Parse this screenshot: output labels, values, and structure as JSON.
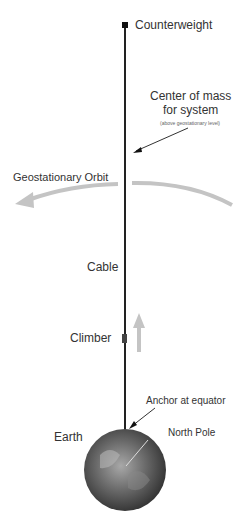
{
  "diagram": {
    "labels": {
      "counterweight": "Counterweight",
      "center_of_mass_line1": "Center of mass",
      "center_of_mass_line2": "for system",
      "center_of_mass_note": "(above geostationary level)",
      "geostationary_orbit": "Geostationary Orbit",
      "cable": "Cable",
      "climber": "Climber",
      "anchor": "Anchor at equator",
      "earth": "Earth",
      "north_pole": "North Pole"
    },
    "colors": {
      "cable": "#222222",
      "orbit_arrow": "#bbbbbb",
      "climber_arrow": "#bbbbbb",
      "earth_dark": "#3a3a3a",
      "earth_light": "#9a9a9a"
    }
  }
}
